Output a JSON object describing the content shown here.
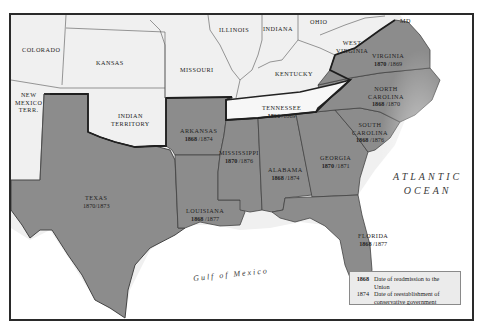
{
  "map": {
    "title": "Reconstruction in the South",
    "colors": {
      "confederate_states": "#8c8c8c",
      "other_states": "#efefef",
      "water": "#ffffff",
      "border": "#333333",
      "legend_bg": "#ebebeb"
    },
    "non_confederate_labels": [
      {
        "id": "colorado",
        "name": "COLORADO"
      },
      {
        "id": "kansas",
        "name": "KANSAS"
      },
      {
        "id": "missouri",
        "name": "MISSOURI"
      },
      {
        "id": "illinois",
        "name": "ILLINOIS"
      },
      {
        "id": "indiana",
        "name": "INDIANA"
      },
      {
        "id": "ohio",
        "name": "OHIO"
      },
      {
        "id": "west-virginia",
        "name_line1": "WEST",
        "name_line2": "VIRGINIA"
      },
      {
        "id": "kentucky",
        "name": "KENTUCKY"
      },
      {
        "id": "new-mexico",
        "name_line1": "NEW",
        "name_line2": "MEXICO",
        "name_line3": "TERR."
      },
      {
        "id": "indian-territory",
        "name_line1": "INDIAN",
        "name_line2": "TERRITORY"
      },
      {
        "id": "maryland",
        "name": "MD"
      }
    ],
    "states": [
      {
        "id": "virginia",
        "name_line1": "VIRGINIA",
        "name_line2": "",
        "readmission": "1870",
        "conservative": "1869"
      },
      {
        "id": "north-carolina",
        "name_line1": "NORTH",
        "name_line2": "CAROLINA",
        "readmission": "1868",
        "conservative": "1870"
      },
      {
        "id": "south-carolina",
        "name_line1": "SOUTH",
        "name_line2": "CAROLINA",
        "readmission": "1868",
        "conservative": "1876"
      },
      {
        "id": "georgia",
        "name_line1": "GEORGIA",
        "name_line2": "",
        "readmission": "1870",
        "conservative": "1871"
      },
      {
        "id": "florida",
        "name_line1": "FLORIDA",
        "name_line2": "",
        "readmission": "1868",
        "conservative": "1877"
      },
      {
        "id": "alabama",
        "name_line1": "ALABAMA",
        "name_line2": "",
        "readmission": "1868",
        "conservative": "1874"
      },
      {
        "id": "mississippi",
        "name_line1": "MISSISSIPPI",
        "name_line2": "",
        "readmission": "1870",
        "conservative": "1876"
      },
      {
        "id": "louisiana",
        "name_line1": "LOUISIANA",
        "name_line2": "",
        "readmission": "1868",
        "conservative": "1877"
      },
      {
        "id": "arkansas",
        "name_line1": "ARKANSAS",
        "name_line2": "",
        "readmission": "1868",
        "conservative": "1874"
      },
      {
        "id": "texas",
        "name_line1": "TEXAS",
        "name_line2": "",
        "readmission": "1870",
        "conservative": "1873"
      },
      {
        "id": "tennessee",
        "name_line1": "TENNESSEE",
        "name_line2": "",
        "readmission": "1866",
        "conservative": "1869"
      }
    ],
    "water_labels": {
      "atlantic_line1": "ATLANTIC",
      "atlantic_line2": "OCEAN",
      "gulf": "Gulf of Mexico"
    },
    "legend": {
      "row1_key": "1868",
      "row1_text": "Date of readmission to the Union",
      "row2_key": "1874",
      "row2_text_line1": "Date of reestablishment of",
      "row2_text_line2": "conservative government"
    }
  }
}
